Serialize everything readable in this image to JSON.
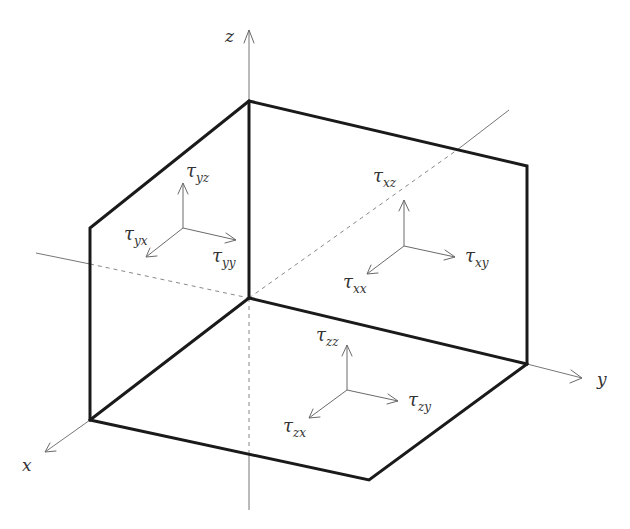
{
  "axes": {
    "x": {
      "label": "x"
    },
    "y": {
      "label": "y"
    },
    "z": {
      "label": "z"
    }
  },
  "stress_groups": [
    {
      "face": "yz-face (left)",
      "components": [
        {
          "symbol": "τ",
          "subscript": "yz",
          "direction": "up"
        },
        {
          "symbol": "τ",
          "subscript": "yx",
          "direction": "down-left"
        },
        {
          "symbol": "τ",
          "subscript": "yy",
          "direction": "right"
        }
      ]
    },
    {
      "face": "xz-face (back right)",
      "components": [
        {
          "symbol": "τ",
          "subscript": "xz",
          "direction": "up"
        },
        {
          "symbol": "τ",
          "subscript": "xx",
          "direction": "down-left"
        },
        {
          "symbol": "τ",
          "subscript": "xy",
          "direction": "right"
        }
      ]
    },
    {
      "face": "xy-face (bottom)",
      "components": [
        {
          "symbol": "τ",
          "subscript": "zz",
          "direction": "up"
        },
        {
          "symbol": "τ",
          "subscript": "zx",
          "direction": "down-left"
        },
        {
          "symbol": "τ",
          "subscript": "zy",
          "direction": "right"
        }
      ]
    }
  ],
  "colors": {
    "edges": "#1a1a1a",
    "axes": "#777777",
    "vectors": "#6a6a6a",
    "text": "#333333"
  }
}
